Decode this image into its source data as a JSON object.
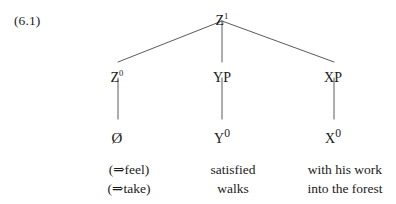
{
  "figure": {
    "example_number": "(6.1)",
    "type": "syntactic-tree-diagram"
  },
  "tree": {
    "root": {
      "label": "Z",
      "superscript": "1",
      "full": "Z¹",
      "x": 222,
      "y": 14
    },
    "level2": [
      {
        "label": "Z",
        "superscript": "0",
        "full": "Z⁰",
        "x": 117,
        "y": 71
      },
      {
        "label": "YP",
        "superscript": "",
        "full": "YP",
        "x": 222,
        "y": 71
      },
      {
        "label": "XP",
        "superscript": "",
        "full": "XP",
        "x": 333,
        "y": 71
      }
    ],
    "terminals": [
      {
        "full": "Ø",
        "label": "Ø",
        "superscript": "",
        "x": 117,
        "y": 128
      },
      {
        "full": "Y⁰",
        "label": "Y",
        "superscript": "0",
        "x": 222,
        "y": 128
      },
      {
        "full": "X⁰",
        "label": "X",
        "superscript": "0",
        "x": 333,
        "y": 128
      }
    ],
    "edges": [
      {
        "from": "Z1",
        "to": "Z0",
        "x1": 222,
        "y1": 21,
        "x2": 118,
        "y2": 62
      },
      {
        "from": "Z1",
        "to": "YP",
        "x1": 222,
        "y1": 21,
        "x2": 222,
        "y2": 62
      },
      {
        "from": "Z1",
        "to": "XP",
        "x1": 222,
        "y1": 21,
        "x2": 334,
        "y2": 62
      },
      {
        "from": "Z0",
        "to": "empty",
        "x1": 118,
        "y1": 78,
        "x2": 118,
        "y2": 119
      },
      {
        "from": "YP",
        "to": "Y0",
        "x1": 222,
        "y1": 78,
        "x2": 222,
        "y2": 119
      },
      {
        "from": "XP",
        "to": "X0",
        "x1": 334,
        "y1": 78,
        "x2": 334,
        "y2": 119
      }
    ]
  },
  "glosses": {
    "columns": [
      {
        "x": 129,
        "lines": [
          "(⇒feel)",
          "(⇒take)"
        ]
      },
      {
        "x": 233,
        "lines": [
          "satisfied",
          "walks"
        ]
      },
      {
        "x": 345,
        "lines": [
          "with his work",
          "into the forest"
        ]
      }
    ],
    "top": 160
  },
  "style": {
    "line_color": "#45474a",
    "text_color": "#1a1a1a",
    "background": "#ffffff"
  }
}
